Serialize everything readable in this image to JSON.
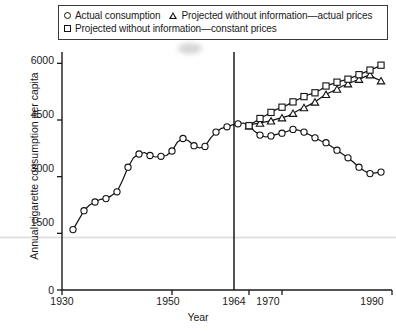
{
  "legend": {
    "entries": [
      {
        "marker": "circle-marker",
        "label": "Actual consumption"
      },
      {
        "marker": "triangle-marker",
        "label": "Projected without information—actual prices"
      },
      {
        "marker": "square-marker",
        "label": "Projected without information—constant prices"
      }
    ]
  },
  "axes": {
    "ylabel": "Annual cigarette consumption per capita",
    "xlabel": "Year",
    "xticks": [
      "1930",
      "1950",
      "1964",
      "1970",
      "1990"
    ],
    "yticks": [
      "0",
      "1500",
      "3000",
      "4500",
      "6000"
    ]
  },
  "annotations": {
    "reference_year": "1964"
  },
  "colors": {
    "line": "#111111",
    "marker_fill": "#ffffff",
    "axis": "#1a1a1a",
    "frame": "#3a3a3a"
  },
  "chart_data": {
    "type": "line",
    "title": "",
    "xlabel": "Year",
    "ylabel": "Annual cigarette consumption per capita",
    "xlim": [
      1930,
      1990
    ],
    "ylim": [
      0,
      6300
    ],
    "xticks": [
      1930,
      1950,
      1964,
      1970,
      1990
    ],
    "yticks": [
      0,
      1500,
      3000,
      4500,
      6000
    ],
    "grid": false,
    "legend_position": "top",
    "annotations": [
      {
        "type": "vline",
        "x": 1964,
        "label": "1964"
      }
    ],
    "series": [
      {
        "name": "Actual consumption",
        "marker": "circle",
        "x": [
          1932,
          1933,
          1934,
          1935,
          1936,
          1937,
          1938,
          1939,
          1940,
          1941,
          1942,
          1943,
          1944,
          1945,
          1946,
          1947,
          1948,
          1949,
          1950,
          1951,
          1952,
          1953,
          1954,
          1955,
          1956,
          1957,
          1958,
          1959,
          1960,
          1961,
          1962,
          1963,
          1964,
          1965,
          1966,
          1967,
          1968,
          1969,
          1970,
          1971,
          1972,
          1973,
          1974,
          1975,
          1976,
          1977,
          1978,
          1979,
          1980,
          1981,
          1982,
          1983,
          1984,
          1985,
          1986,
          1987,
          1988
        ],
        "y": [
          1600,
          1850,
          2100,
          2250,
          2330,
          2400,
          2420,
          2500,
          2600,
          2900,
          3250,
          3500,
          3600,
          3640,
          3560,
          3520,
          3540,
          3560,
          3680,
          3920,
          4010,
          3950,
          3820,
          3760,
          3800,
          4020,
          4180,
          4280,
          4320,
          4370,
          4400,
          4420,
          4350,
          4200,
          4100,
          4050,
          4080,
          4120,
          4150,
          4200,
          4250,
          4230,
          4180,
          4110,
          4030,
          3950,
          3900,
          3800,
          3700,
          3600,
          3500,
          3380,
          3250,
          3150,
          3080,
          3100,
          3120
        ]
      },
      {
        "name": "Projected without information—actual prices",
        "marker": "triangle",
        "x": [
          1964,
          1965,
          1966,
          1967,
          1968,
          1969,
          1970,
          1971,
          1972,
          1973,
          1974,
          1975,
          1976,
          1977,
          1978,
          1979,
          1980,
          1981,
          1982,
          1983,
          1984,
          1985,
          1986,
          1987,
          1988
        ],
        "y": [
          4350,
          4400,
          4420,
          4450,
          4480,
          4520,
          4560,
          4600,
          4680,
          4760,
          4830,
          4900,
          4980,
          5080,
          5180,
          5250,
          5320,
          5400,
          5460,
          5520,
          5580,
          5640,
          5700,
          5600,
          5540
        ]
      },
      {
        "name": "Projected without information—constant prices",
        "marker": "square",
        "x": [
          1964,
          1965,
          1966,
          1967,
          1968,
          1969,
          1970,
          1971,
          1972,
          1973,
          1974,
          1975,
          1976,
          1977,
          1978,
          1979,
          1980,
          1981,
          1982,
          1983,
          1984,
          1985,
          1986,
          1987,
          1988
        ],
        "y": [
          4350,
          4450,
          4540,
          4620,
          4700,
          4780,
          4840,
          4900,
          4980,
          5050,
          5120,
          5180,
          5220,
          5300,
          5400,
          5450,
          5500,
          5540,
          5580,
          5640,
          5700,
          5760,
          5820,
          5880,
          5950
        ]
      }
    ]
  }
}
